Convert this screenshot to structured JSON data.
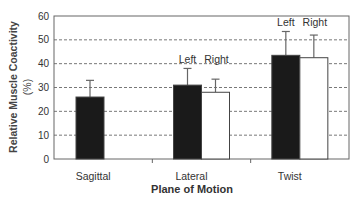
{
  "chart_data": {
    "type": "bar",
    "title": "",
    "xlabel": "Plane of Motion",
    "ylabel": "Relative Muscle Coactivity",
    "ylabel_unit": "(%)",
    "ylim": [
      0,
      60
    ],
    "yticks": [
      0,
      10,
      20,
      30,
      40,
      50,
      60
    ],
    "grid": "horizontal dashed",
    "legend": "none (inline Left/Right annotations above bars)",
    "categories": [
      "Sagittal",
      "Lateral",
      "Twist"
    ],
    "series": [
      {
        "name": "Left",
        "color": "#1a1a1a",
        "values": [
          26,
          31,
          43.5
        ],
        "error_upper": [
          33,
          38,
          53.5
        ]
      },
      {
        "name": "Right",
        "color": "#ffffff",
        "values": [
          null,
          28,
          42.5
        ],
        "error_upper": [
          null,
          33.5,
          52
        ]
      }
    ],
    "annotations": [
      {
        "group": "Lateral",
        "labels": [
          "Left",
          "Right"
        ]
      },
      {
        "group": "Twist",
        "labels": [
          "Left",
          "Right"
        ]
      }
    ]
  }
}
